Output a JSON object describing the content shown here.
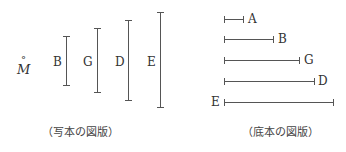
{
  "left_figure": {
    "symbol": "M",
    "symbol_accent": "°",
    "caption": "（写本の図版）",
    "bars": [
      {
        "label": "B",
        "x": 66,
        "y1": 36,
        "y2": 86
      },
      {
        "label": "G",
        "x": 97,
        "y1": 28,
        "y2": 93
      },
      {
        "label": "D",
        "x": 128,
        "y1": 20,
        "y2": 101
      },
      {
        "label": "E",
        "x": 160,
        "y1": 12,
        "y2": 108
      }
    ]
  },
  "right_figure": {
    "caption": "（底本の図版）",
    "bars": [
      {
        "label": "A",
        "y": 19,
        "x1": 224,
        "x2": 244
      },
      {
        "label": "B",
        "y": 39,
        "x1": 224,
        "x2": 274
      },
      {
        "label": "G",
        "y": 60,
        "x1": 224,
        "x2": 300
      },
      {
        "label": "D",
        "y": 81,
        "x1": 224,
        "x2": 315
      },
      {
        "label": "E",
        "y": 102,
        "x1": 224,
        "x2": 334
      }
    ]
  },
  "colors": {
    "line": "#555555",
    "text": "#333333"
  }
}
